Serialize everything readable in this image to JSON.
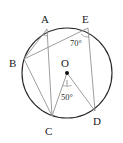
{
  "figure": {
    "type": "circle-geometry-diagram",
    "canvas": {
      "width": 123,
      "height": 143,
      "background": "#ffffff"
    },
    "colors": {
      "circle_stroke": "#2b2b2b",
      "chord_stroke": "#8c8c8c",
      "label_text": "#1a1a1a",
      "angle_text": "#2a2a2a",
      "center_dot": "#111111"
    },
    "circle": {
      "cx": 67,
      "cy": 73,
      "r": 45
    },
    "center": {
      "label": "O",
      "x": 67,
      "y": 73,
      "label_x": 64,
      "label_y": 65
    },
    "points": [
      {
        "id": "A",
        "label": "A",
        "x": 47,
        "y": 29,
        "label_x": 44,
        "label_y": 23
      },
      {
        "id": "B",
        "label": "B",
        "x": 24,
        "y": 59,
        "label_x": 14,
        "label_y": 66
      },
      {
        "id": "C",
        "label": "C",
        "x": 52,
        "y": 116,
        "label_x": 47,
        "label_y": 132
      },
      {
        "id": "D",
        "label": "D",
        "x": 95,
        "y": 111,
        "label_x": 96,
        "label_y": 124
      },
      {
        "id": "E",
        "label": "E",
        "x": 88,
        "y": 28,
        "label_x": 85,
        "label_y": 22
      }
    ],
    "segments": [
      {
        "name": "chord-A-B",
        "from": "A",
        "to": "B"
      },
      {
        "name": "chord-A-C",
        "from": "A",
        "to": "C"
      },
      {
        "name": "chord-B-E",
        "from": "B",
        "to": "E"
      },
      {
        "name": "chord-E-D",
        "from": "E",
        "to": "D"
      },
      {
        "name": "radius-O-C",
        "from": "O",
        "to": "C"
      },
      {
        "name": "radius-O-D",
        "from": "O",
        "to": "D"
      }
    ],
    "angles": [
      {
        "name": "angle-at-E",
        "value": "70",
        "unit": "°",
        "text": "70°",
        "vertex": "E",
        "text_x": 72,
        "text_y": 45
      },
      {
        "name": "angle-at-O",
        "value": "50",
        "unit": "°",
        "text": "50°",
        "vertex": "O",
        "text_x": 62,
        "text_y": 99
      }
    ],
    "angle_marks": [
      {
        "name": "angle-arc-at-A",
        "vertex": "A"
      },
      {
        "name": "angle-arc-at-E",
        "vertex": "E"
      },
      {
        "name": "angle-arc-at-O",
        "vertex": "O"
      }
    ]
  }
}
